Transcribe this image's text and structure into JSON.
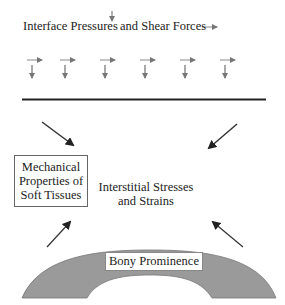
{
  "diagram": {
    "header": {
      "part1": "Interface Pressures",
      "part2": "and Shear Forces",
      "pressure_icon": "down-arrow-icon",
      "shear_icon": "right-arrow-icon"
    },
    "force_pairs_count": 6,
    "mechanical_box": {
      "line1": "Mechanical",
      "line2": "Properties of",
      "line3": "Soft Tissues"
    },
    "interstitial": {
      "line1": "Interstitial Stresses",
      "line2": "and Strains"
    },
    "bone_label": "Bony Prominence",
    "colors": {
      "arrow_light": "#888888",
      "arrow_dark": "#333333",
      "bone_fill": "#999999",
      "line": "#222222"
    }
  }
}
